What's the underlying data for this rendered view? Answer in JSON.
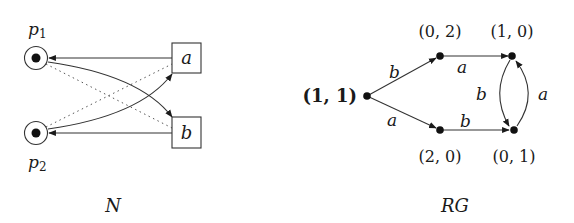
{
  "petri_net": {
    "caption": "N",
    "places": [
      {
        "id": "p1",
        "label": "p",
        "subscript": "1",
        "tokens": 1
      },
      {
        "id": "p2",
        "label": "p",
        "subscript": "2",
        "tokens": 1
      }
    ],
    "transitions": [
      {
        "id": "a",
        "label": "a"
      },
      {
        "id": "b",
        "label": "b"
      }
    ],
    "arcs": [
      {
        "from": "a",
        "to": "p1",
        "style": "solid"
      },
      {
        "from": "b",
        "to": "p2",
        "style": "solid"
      },
      {
        "from": "p1",
        "to": "b",
        "style": "solid"
      },
      {
        "from": "p2",
        "to": "a",
        "style": "solid"
      },
      {
        "from": "p1",
        "to": "b",
        "style": "dotted"
      },
      {
        "from": "p2",
        "to": "a",
        "style": "dotted"
      }
    ]
  },
  "reachability_graph": {
    "caption": "RG",
    "initial": "(1, 1)",
    "nodes": [
      {
        "id": "n11",
        "label": "(1, 1)",
        "initial": true
      },
      {
        "id": "n02",
        "label": "(0, 2)"
      },
      {
        "id": "n10",
        "label": "(1, 0)"
      },
      {
        "id": "n20",
        "label": "(2, 0)"
      },
      {
        "id": "n01",
        "label": "(0, 1)"
      }
    ],
    "edges": [
      {
        "from": "(1, 1)",
        "to": "(0, 2)",
        "label": "b"
      },
      {
        "from": "(1, 1)",
        "to": "(2, 0)",
        "label": "a"
      },
      {
        "from": "(0, 2)",
        "to": "(1, 0)",
        "label": "a"
      },
      {
        "from": "(2, 0)",
        "to": "(0, 1)",
        "label": "b"
      },
      {
        "from": "(1, 0)",
        "to": "(0, 1)",
        "label": "b"
      },
      {
        "from": "(0, 1)",
        "to": "(1, 0)",
        "label": "a"
      }
    ]
  },
  "colors": {
    "stroke": "#333333",
    "text": "#1a1a1a",
    "background": "#ffffff"
  }
}
